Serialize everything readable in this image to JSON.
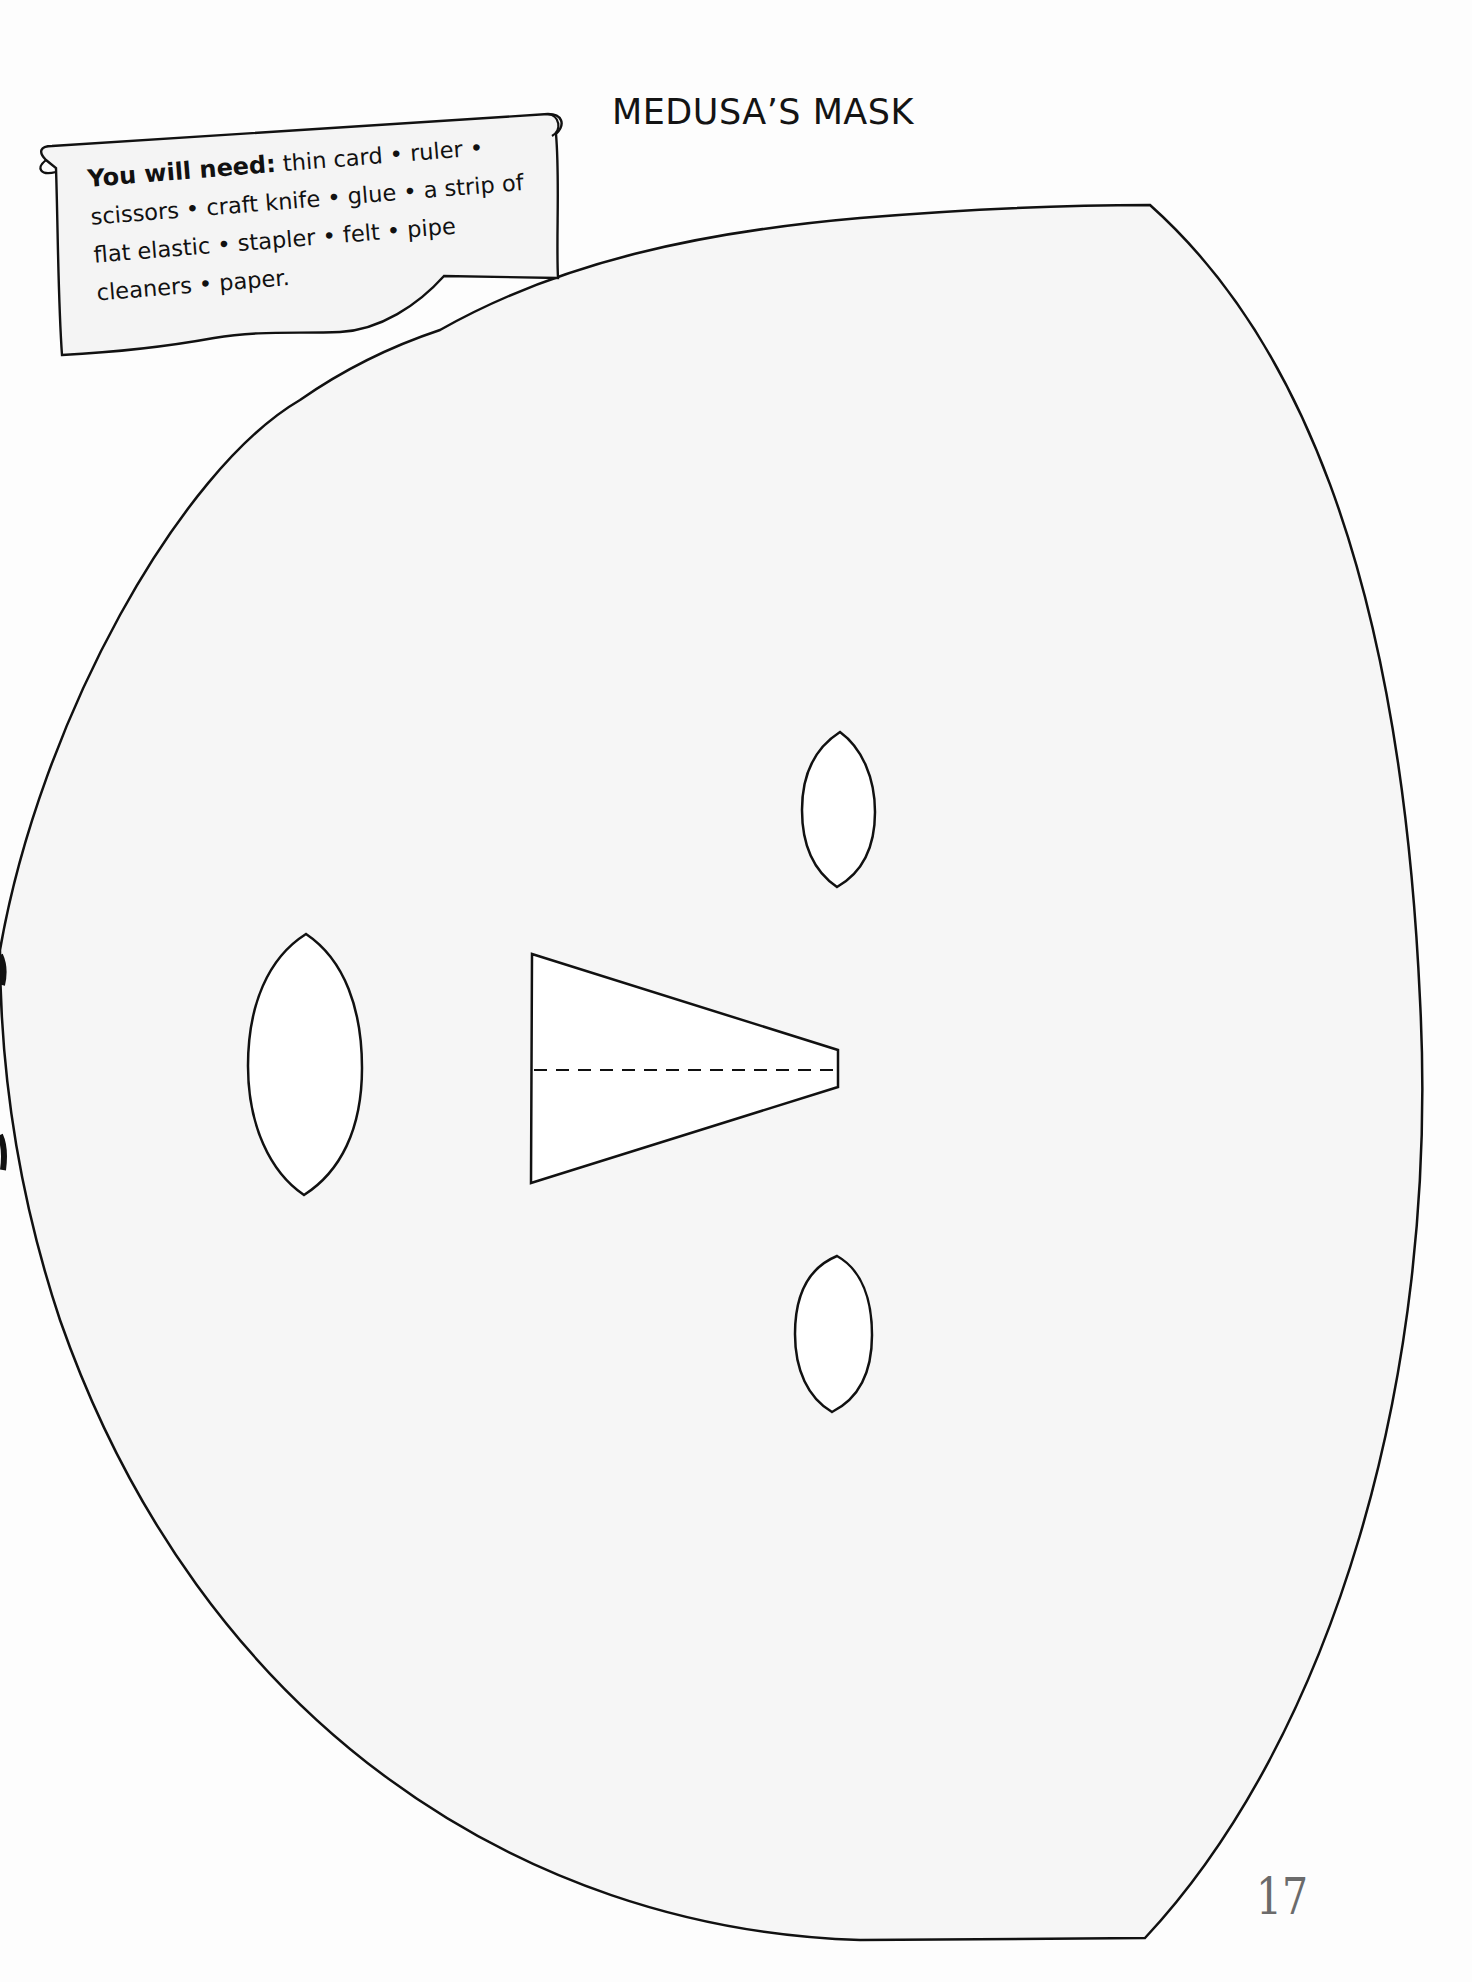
{
  "page": {
    "title": "MEDUSA’S MASK",
    "page_number": "17"
  },
  "materials_box": {
    "lead": "You will need:",
    "items_text": " thin card • ruler • scissors • craft knife • glue • a strip of flat elastic • stapler • felt • pipe cleaners • paper.",
    "items": [
      "thin card",
      "ruler",
      "scissors",
      "craft knife",
      "glue",
      "a strip of flat elastic",
      "stapler",
      "felt",
      "pipe cleaners",
      "paper"
    ]
  },
  "template": {
    "shapes": [
      {
        "name": "mask-outline",
        "type": "cut-line"
      },
      {
        "name": "left-eye-hole",
        "type": "cut-out",
        "shape": "lens"
      },
      {
        "name": "top-oval-hole",
        "type": "cut-out",
        "shape": "oval"
      },
      {
        "name": "bottom-oval-hole",
        "type": "cut-out",
        "shape": "oval"
      },
      {
        "name": "nose-piece",
        "type": "cut-and-fold",
        "fold_line": "dashed"
      }
    ],
    "colors": {
      "line": "#111111",
      "page": "#f9f9f9",
      "hole_fill": "#ffffff",
      "page_number": "#6b6b6b"
    }
  }
}
